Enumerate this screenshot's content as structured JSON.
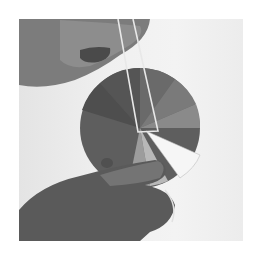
{
  "image": {
    "subject": "hands holding a color wheel disc with a string loop",
    "description": "Photograph of two hands holding a segmented circular color wheel; a thin string loop hangs from the top hand down to the center of the wheel; a light wedge-shaped segment is pulled out at the lower right.",
    "colors": {
      "background": "#f0f0f0",
      "wheel_dark": "#5a5a5a",
      "wheel_mid": "#7a7a7a",
      "wheel_light": "#9a9a9a",
      "wedge": "#f4f4f4",
      "skin": "#6a6a6a"
    }
  }
}
